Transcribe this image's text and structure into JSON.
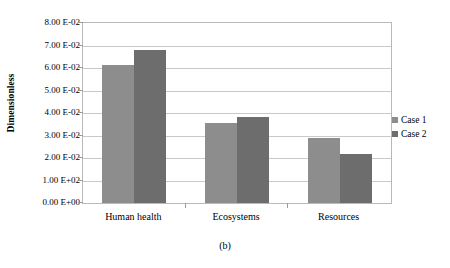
{
  "chart_data": {
    "type": "bar",
    "title": "",
    "caption": "(b)",
    "xlabel": "",
    "ylabel": "Dimensionless",
    "categories": [
      "Human health",
      "Ecosystems",
      "Resources"
    ],
    "series": [
      {
        "name": "Case 1",
        "color": "#8d8d8d",
        "values": [
          0.0612,
          0.0356,
          0.0287
        ]
      },
      {
        "name": "Case 2",
        "color": "#6d6d6d",
        "values": [
          0.0678,
          0.0382,
          0.022
        ]
      }
    ],
    "ylim": [
      0.0,
      0.08
    ],
    "ytick_values": [
      0.0,
      0.01,
      0.02,
      0.03,
      0.04,
      0.05,
      0.06,
      0.07,
      0.08
    ],
    "ytick_labels": [
      "0.00 E+00",
      "1.00 E+02",
      "2.00 E-02",
      "3.00 E-02",
      "4.00 E-02",
      "5.00 E-02",
      "6.00 E-02",
      "7.00 E-02",
      "8.00 E-02"
    ],
    "grid": true,
    "legend_position": "right"
  }
}
